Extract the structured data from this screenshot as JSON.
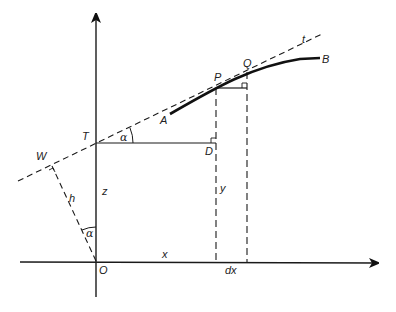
{
  "diagram": {
    "title": "",
    "labels": {
      "A": "A",
      "B": "B",
      "P": "P",
      "Q": "Q",
      "T": "T",
      "D": "D",
      "W": "W",
      "O": "O",
      "t": "t",
      "x": "x",
      "y": "y",
      "z": "z",
      "h": "h",
      "dx": "dx",
      "alpha_at_T": "α",
      "alpha_at_O": "α"
    },
    "elements": {
      "vertical_axis": "z-axis with arrowhead (upward)",
      "horizontal_axis": "x-axis with arrowhead (rightward)",
      "curve": "solid thick curve from A through P and Q to B",
      "tangent": "dashed tangent line t through W, T, P, Q",
      "horizontal_TD": "solid line from T to D",
      "horizontal_PQ": "solid short line from P to foot below Q",
      "verticals": "dashed verticals from P and Q down to x-axis",
      "perpendicular_h": "dashed line from O to W perpendicular to tangent"
    },
    "colors": {
      "stroke": "#1a1a1a",
      "background": "#ffffff"
    }
  }
}
